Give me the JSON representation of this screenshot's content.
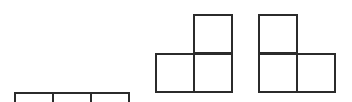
{
  "diagram": {
    "title": "",
    "cell_size": 40,
    "line_color": "#2b2b2b",
    "background": "#ffffff",
    "shapes": [
      {
        "name": "straight-tromino",
        "origin": [
          14,
          53
        ],
        "cells": [
          [
            0,
            1
          ],
          [
            1,
            1
          ],
          [
            2,
            1
          ]
        ]
      },
      {
        "name": "l-tromino-right-up",
        "origin": [
          155,
          14
        ],
        "cells": [
          [
            1,
            0
          ],
          [
            0,
            1
          ],
          [
            1,
            1
          ]
        ]
      },
      {
        "name": "l-tromino-left-up",
        "origin": [
          258,
          14
        ],
        "cells": [
          [
            0,
            0
          ],
          [
            0,
            1
          ],
          [
            1,
            1
          ]
        ]
      }
    ]
  }
}
